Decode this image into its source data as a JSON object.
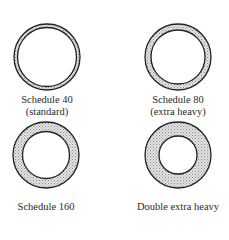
{
  "diagram": {
    "type": "pipe wall thickness comparison",
    "colors": {
      "outline": "#222222",
      "wall_fill": "#c9c9c9",
      "background": "#ffffff"
    },
    "items": [
      {
        "id": "sch40",
        "label": "Schedule 40",
        "sublabel": "(standard)",
        "cx": 47,
        "cy": 57,
        "outer_r": 33,
        "inner_r": 29.5
      },
      {
        "id": "sch80",
        "label": "Schedule 80",
        "sublabel": "(extra heavy)",
        "cx": 178,
        "cy": 57,
        "outer_r": 33,
        "inner_r": 27
      },
      {
        "id": "sch160",
        "label": "Schedule 160",
        "sublabel": "",
        "cx": 46,
        "cy": 155,
        "outer_r": 33,
        "inner_r": 23.5
      },
      {
        "id": "dxh",
        "label": "Double extra heavy",
        "sublabel": "",
        "cx": 178,
        "cy": 155,
        "outer_r": 33,
        "inner_r": 19
      }
    ]
  }
}
